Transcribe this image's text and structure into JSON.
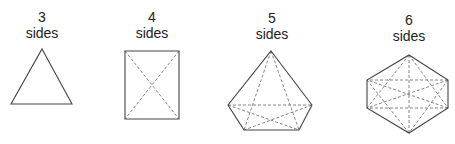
{
  "figure": {
    "shapes": [
      {
        "id": "triangle",
        "count_label": "3",
        "sides_label": "sides",
        "vertices": [
          [
            42,
            49
          ],
          [
            72,
            104
          ],
          [
            11,
            104
          ]
        ],
        "diagonals": [],
        "label_center_x": 42,
        "label_top": 9
      },
      {
        "id": "quadrilateral",
        "count_label": "4",
        "sides_label": "sides",
        "vertices": [
          [
            125,
            51
          ],
          [
            179,
            51
          ],
          [
            179,
            119
          ],
          [
            125,
            119
          ]
        ],
        "diagonals": [
          [
            [
              125,
              51
            ],
            [
              179,
              119
            ]
          ],
          [
            [
              179,
              51
            ],
            [
              125,
              119
            ]
          ]
        ],
        "label_center_x": 152,
        "label_top": 9
      },
      {
        "id": "pentagon",
        "count_label": "5",
        "sides_label": "sides",
        "vertices": [
          [
            271,
            51
          ],
          [
            312,
            105
          ],
          [
            299,
            130
          ],
          [
            244,
            130
          ],
          [
            228,
            105
          ]
        ],
        "diagonals": [
          [
            [
              271,
              51
            ],
            [
              299,
              130
            ]
          ],
          [
            [
              271,
              51
            ],
            [
              244,
              130
            ]
          ],
          [
            [
              228,
              105
            ],
            [
              312,
              105
            ]
          ],
          [
            [
              228,
              105
            ],
            [
              299,
              130
            ]
          ],
          [
            [
              312,
              105
            ],
            [
              244,
              130
            ]
          ]
        ],
        "label_center_x": 272,
        "label_top": 10
      },
      {
        "id": "hexagon",
        "count_label": "6",
        "sides_label": "sides",
        "vertices": [
          [
            409,
            55
          ],
          [
            448,
            80
          ],
          [
            448,
            108
          ],
          [
            409,
            133
          ],
          [
            367,
            108
          ],
          [
            367,
            80
          ]
        ],
        "diagonals": [
          [
            [
              409,
              55
            ],
            [
              448,
              108
            ]
          ],
          [
            [
              409,
              55
            ],
            [
              409,
              133
            ]
          ],
          [
            [
              409,
              55
            ],
            [
              367,
              108
            ]
          ],
          [
            [
              448,
              80
            ],
            [
              409,
              133
            ]
          ],
          [
            [
              448,
              80
            ],
            [
              367,
              108
            ]
          ],
          [
            [
              448,
              80
            ],
            [
              367,
              80
            ]
          ],
          [
            [
              448,
              108
            ],
            [
              367,
              108
            ]
          ],
          [
            [
              448,
              108
            ],
            [
              367,
              80
            ]
          ],
          [
            [
              409,
              133
            ],
            [
              367,
              80
            ]
          ]
        ],
        "label_center_x": 409,
        "label_top": 12
      }
    ],
    "colors": {
      "outline": "#444444",
      "diagonal": "#777777",
      "text": "#222222"
    }
  }
}
